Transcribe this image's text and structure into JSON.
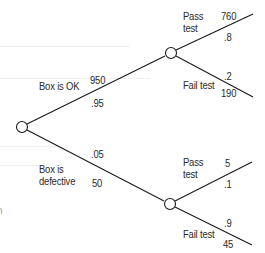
{
  "diagram": {
    "type": "decision-tree",
    "colors": {
      "line": "#1a1a1a",
      "node_fill": "#ffffff",
      "text": "#2a2a2a",
      "background": "#ffffff"
    },
    "nodes": {
      "root": {
        "x": 22,
        "y": 127
      },
      "ok": {
        "x": 171,
        "y": 53
      },
      "defective": {
        "x": 170,
        "y": 204
      }
    },
    "branches": {
      "box_ok": {
        "label": "Box is OK",
        "count": "950",
        "probability": ".95"
      },
      "box_defective": {
        "label": "Box is\ndefective",
        "count": "50",
        "probability": ".05"
      },
      "ok_pass": {
        "label": "Pass\ntest",
        "count": "760",
        "probability": ".8"
      },
      "ok_fail": {
        "label": "Fail test",
        "count": "190",
        "probability": ".2"
      },
      "def_pass": {
        "label": "Pass\ntest",
        "count": "5",
        "probability": ".1"
      },
      "def_fail": {
        "label": "Fail test",
        "count": "45",
        "probability": ".9"
      }
    },
    "left_edge_fragment": "n"
  }
}
